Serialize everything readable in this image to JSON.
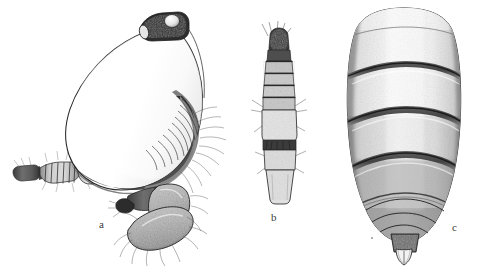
{
  "plate": {
    "type": "scientific-illustration-plate",
    "medium": "ink stipple drawing",
    "background_color": "#ffffff",
    "ink_color": "#2b2b2b",
    "width": 483,
    "height": 266,
    "top_edge_artifact": "",
    "figures": [
      {
        "id": "a",
        "label": "a",
        "label_x": 103,
        "label_y": 225,
        "description": "Lateral view of body with large rounded idiosoma, dark head capsule with eye at top, segmented anterior appendage extending left, and setose legs/palps below right",
        "bbox": {
          "x": 8,
          "y": 10,
          "w": 230,
          "h": 250
        }
      },
      {
        "id": "b",
        "label": "b",
        "label_x": 275,
        "label_y": 218,
        "description": "Elongate segmented appendage (leg or antenna) with dark distal segments bearing setae and pale basal segments",
        "bbox": {
          "x": 247,
          "y": 18,
          "w": 52,
          "h": 185
        }
      },
      {
        "id": "c",
        "label": "c",
        "label_x": 456,
        "label_y": 228,
        "description": "Dorsal view of segmented abdomen tapering posteriorly to a terminal tube bearing paired pale cerci",
        "bbox": {
          "x": 330,
          "y": 5,
          "w": 135,
          "h": 255
        }
      }
    ]
  }
}
